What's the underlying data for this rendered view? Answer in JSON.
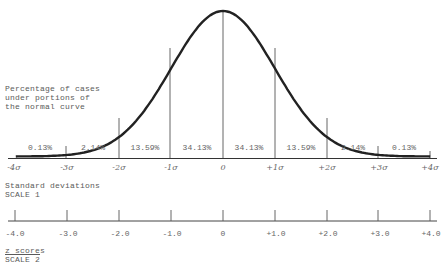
{
  "annotation": {
    "line1": "Percentage of cases",
    "line2": "under portions of",
    "line3": "the normal curve"
  },
  "segments": [
    {
      "label": "0.13%",
      "x": 40
    },
    {
      "label": "2.14%",
      "x": 93
    },
    {
      "label": "13.59%",
      "x": 145
    },
    {
      "label": "34.13%",
      "x": 197
    },
    {
      "label": "34.13%",
      "x": 249
    },
    {
      "label": "13.59%",
      "x": 301
    },
    {
      "label": "2.14%",
      "x": 353
    },
    {
      "label": "0.13%",
      "x": 404
    }
  ],
  "scale1": {
    "title": "Standard deviations",
    "subtitle": "SCALE 1",
    "ticks": [
      "-4σ",
      "-3σ",
      "-2σ",
      "-1σ",
      "0",
      "+1σ",
      "+2σ",
      "+3σ",
      "+4σ"
    ]
  },
  "scale2": {
    "title": "z scores",
    "subtitle": "SCALE 2",
    "ticks": [
      "-4.0",
      "-3.0",
      "-2.0",
      "-1.0",
      "0",
      "+1.0",
      "+2.0",
      "+3.0",
      "+4.0"
    ]
  },
  "chart_data": {
    "type": "area",
    "x": [
      -4,
      -3,
      -2,
      -1,
      0,
      1,
      2,
      3,
      4
    ],
    "segments": [
      {
        "from": -4,
        "to": -3,
        "percent": 0.13
      },
      {
        "from": -3,
        "to": -2,
        "percent": 2.14
      },
      {
        "from": -2,
        "to": -1,
        "percent": 13.59
      },
      {
        "from": -1,
        "to": 0,
        "percent": 34.13
      },
      {
        "from": 0,
        "to": 1,
        "percent": 34.13
      },
      {
        "from": 1,
        "to": 2,
        "percent": 13.59
      },
      {
        "from": 2,
        "to": 3,
        "percent": 2.14
      },
      {
        "from": 3,
        "to": 4,
        "percent": 0.13
      }
    ],
    "xlabel": "Standard deviations (SCALE 1)",
    "secondary_xlabel": "z scores (SCALE 2)",
    "xtick_labels_scale1": [
      "-4σ",
      "-3σ",
      "-2σ",
      "-1σ",
      "0",
      "+1σ",
      "+2σ",
      "+3σ",
      "+4σ"
    ],
    "xtick_labels_scale2": [
      "-4.0",
      "-3.0",
      "-2.0",
      "-1.0",
      "0",
      "+1.0",
      "+2.0",
      "+3.0",
      "+4.0"
    ],
    "xlim": [
      -4,
      4
    ],
    "grid": false
  }
}
